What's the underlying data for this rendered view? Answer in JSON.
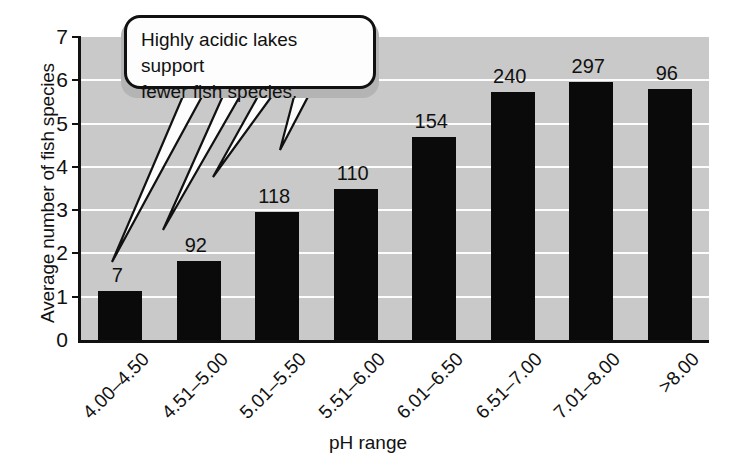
{
  "figure": {
    "kind": "bar-chart-with-callout"
  },
  "callout": {
    "name": "annotation-callout",
    "text": "Highly acidic lakes support fewer fish species.",
    "line1": "Highly acidic lakes support",
    "line2": "fewer fish species.",
    "fill_color": "#fdfdfd",
    "border_color": "#111111",
    "shadow_color": "#b4b4b4",
    "tail_targets": [
      "4.00–4.50",
      "4.51–5.00",
      "5.01–5.50",
      "5.51–6.00"
    ]
  },
  "axes": {
    "x_title": "pH range",
    "y_title": "Average number of fish species",
    "y_ticks": [
      "0",
      "1",
      "2",
      "3",
      "4",
      "5",
      "6",
      "7"
    ],
    "plot_background": "#c9c9c9",
    "gridline_color": "#fdfdfd",
    "axis_color": "#111111"
  },
  "chart_data": {
    "type": "bar",
    "title": "",
    "xlabel": "pH range",
    "ylabel": "Average number of fish species",
    "categories": [
      "4.00–4.50",
      "4.51–5.00",
      "5.01–5.50",
      "5.51–6.00",
      "6.01–6.50",
      "6.51–7.00",
      "7.01–8.00",
      ">8.00"
    ],
    "values": [
      1.13,
      1.82,
      2.95,
      3.5,
      4.7,
      5.72,
      5.95,
      5.8
    ],
    "point_labels": [
      "7",
      "92",
      "118",
      "110",
      "154",
      "240",
      "297",
      "96"
    ],
    "point_label_meaning": "number of lakes sampled",
    "ylim": [
      0,
      7
    ],
    "yticks": [
      0,
      1,
      2,
      3,
      4,
      5,
      6,
      7
    ],
    "grid": true,
    "legend": false,
    "bar_color": "#0a0a0a",
    "annotations": [
      {
        "text": "Highly acidic lakes support fewer fish species.",
        "points_to": [
          "4.00–4.50",
          "4.51–5.00",
          "5.01–5.50",
          "5.51–6.00"
        ]
      }
    ]
  }
}
